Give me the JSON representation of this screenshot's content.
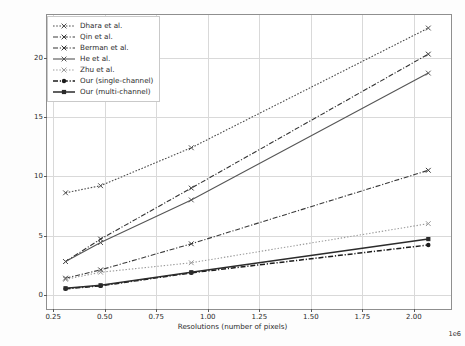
{
  "chart_data": {
    "type": "line",
    "title": "",
    "xlabel": "Resolutions (number of pixels)",
    "ylabel": "Mean execution time over 5 images, sec",
    "x_offset_text": "1e6",
    "xlim": [
      0.22,
      2.18
    ],
    "ylim": [
      -1.2,
      23.6
    ],
    "xticks": [
      0.25,
      0.5,
      0.75,
      1.0,
      1.25,
      1.5,
      1.75,
      2.0
    ],
    "xticklabels": [
      "0.25",
      "0.50",
      "0.75",
      "1.00",
      "1.25",
      "1.50",
      "1.75",
      "2.00"
    ],
    "yticks": [
      0,
      5,
      10,
      15,
      20
    ],
    "yticklabels": [
      "0",
      "5",
      "10",
      "15",
      "20"
    ],
    "grid": true,
    "legend_position": "upper left",
    "x": [
      0.31,
      0.48,
      0.92,
      2.07
    ],
    "series": [
      {
        "name": "Dhara et al.",
        "values": [
          8.6,
          9.2,
          12.4,
          22.5
        ],
        "color": "#4c4c4c",
        "dash": "densely-dotted",
        "marker": "x"
      },
      {
        "name": "Qin et al.",
        "values": [
          1.4,
          2.1,
          4.3,
          10.5
        ],
        "color": "#3a3a3a",
        "dash": "dash-dot",
        "marker": "x"
      },
      {
        "name": "Berman et al.",
        "values": [
          2.8,
          4.7,
          9.0,
          20.3
        ],
        "color": "#333333",
        "dash": "dash-dot",
        "marker": "x"
      },
      {
        "name": "He et al.",
        "values": [
          2.8,
          4.4,
          8.0,
          18.7
        ],
        "color": "#555555",
        "dash": "solid",
        "marker": "x"
      },
      {
        "name": "Zhu et al.",
        "values": [
          1.3,
          1.9,
          2.7,
          6.0
        ],
        "color": "#9a9a9a",
        "dash": "dotted",
        "marker": "x"
      },
      {
        "name": "Our (single-channel)",
        "values": [
          0.5,
          0.75,
          1.85,
          4.2
        ],
        "color": "#1c1c1c",
        "dash": "dash-dot",
        "marker": "circle"
      },
      {
        "name": "Our (multi-channel)",
        "values": [
          0.55,
          0.8,
          1.9,
          4.7
        ],
        "color": "#2b2b2b",
        "dash": "solid",
        "marker": "square"
      }
    ]
  }
}
